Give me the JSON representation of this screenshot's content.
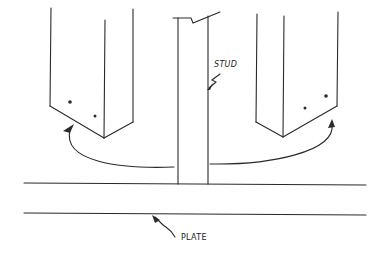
{
  "diagram": {
    "labels": {
      "stud": "STUD",
      "plate": "PLATE"
    },
    "colors": {
      "line": "#2a2a2a",
      "background": "#ffffff"
    },
    "elements": [
      "left-block",
      "right-block",
      "stud",
      "plate",
      "curved-arrow-left",
      "curved-arrow-right",
      "stud-leader",
      "plate-leader"
    ]
  }
}
